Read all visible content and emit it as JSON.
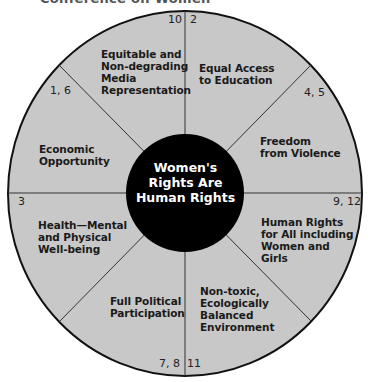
{
  "title_fragment": "Conference on Women",
  "center": {
    "lines": [
      "Women's",
      "Rights Are",
      "Human Rights"
    ]
  },
  "segments": [
    {
      "id": "media",
      "label_lines": [
        "Equitable and",
        "Non-degrading",
        "Media",
        "Representation"
      ],
      "numbers": "10"
    },
    {
      "id": "education",
      "label_lines": [
        "Equal Access",
        "to Education"
      ],
      "numbers": "2"
    },
    {
      "id": "violence",
      "label_lines": [
        "Freedom",
        "from Violence"
      ],
      "numbers": "4, 5"
    },
    {
      "id": "human-rights",
      "label_lines": [
        "Human Rights",
        "for All including",
        "Women and",
        "Girls"
      ],
      "numbers": "9, 12"
    },
    {
      "id": "environment",
      "label_lines": [
        "Non-toxic,",
        "Ecologically",
        "Balanced",
        "Environment"
      ],
      "numbers": "11"
    },
    {
      "id": "political",
      "label_lines": [
        "Full Political",
        "Participation"
      ],
      "numbers": "7, 8"
    },
    {
      "id": "health",
      "label_lines": [
        "Health—Mental",
        "and Physical",
        "Well-being"
      ],
      "numbers": "3"
    },
    {
      "id": "economic",
      "label_lines": [
        "Economic",
        "Opportunity"
      ],
      "numbers": "1, 6"
    }
  ],
  "colors": {
    "wheel_fill": "#c8c8c8",
    "hub_fill": "#000000",
    "lines": "#333333"
  }
}
